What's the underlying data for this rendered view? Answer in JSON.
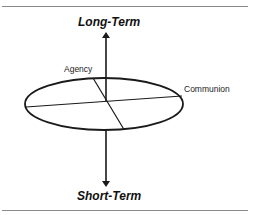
{
  "diagram": {
    "title": "",
    "labels": {
      "top": "Long-Term",
      "bottom": "Short-Term",
      "agency": "Agency",
      "communion": "Communion"
    },
    "colors": {
      "stroke": "#1a1a1a",
      "rule": "#8a8a8a",
      "background": "#ffffff"
    },
    "elements": {
      "ellipse": "disc representing agency-communion plane",
      "vertical_axis": "bidirectional arrow from Short-Term (bottom) to Long-Term (top)",
      "agency_axis": "diagonal line across ellipse",
      "communion_axis": "near-horizontal line across ellipse"
    }
  }
}
